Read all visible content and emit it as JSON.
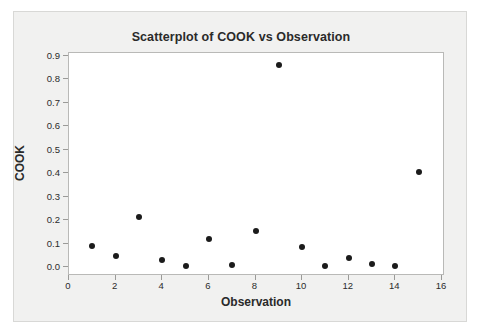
{
  "chart_data": {
    "type": "scatter",
    "title": "Scatterplot of COOK vs Observation",
    "xlabel": "Observation",
    "ylabel": "COOK",
    "xlim": [
      0,
      16
    ],
    "ylim": [
      0.0,
      0.9
    ],
    "xticks": [
      "0",
      "2",
      "4",
      "6",
      "8",
      "10",
      "12",
      "14",
      "16"
    ],
    "xtick_values": [
      0,
      2,
      4,
      6,
      8,
      10,
      12,
      14,
      16
    ],
    "yticks": [
      "0.0",
      "0.1",
      "0.2",
      "0.3",
      "0.4",
      "0.5",
      "0.6",
      "0.7",
      "0.8",
      "0.9"
    ],
    "ytick_values": [
      0.0,
      0.1,
      0.2,
      0.3,
      0.4,
      0.5,
      0.6,
      0.7,
      0.8,
      0.9
    ],
    "grid": false,
    "legend": false,
    "marker_color": "#1b1b1b",
    "marker": "circle",
    "series": [
      {
        "name": "COOK",
        "x": [
          1,
          2,
          3,
          4,
          5,
          6,
          7,
          8,
          9,
          10,
          11,
          12,
          13,
          14,
          15
        ],
        "y": [
          0.09,
          0.047,
          0.212,
          0.029,
          0.004,
          0.12,
          0.01,
          0.154,
          0.862,
          0.085,
          0.004,
          0.038,
          0.012,
          0.003,
          0.406
        ]
      }
    ],
    "points": [
      {
        "x": 1,
        "y": 0.09
      },
      {
        "x": 2,
        "y": 0.047
      },
      {
        "x": 3,
        "y": 0.212
      },
      {
        "x": 4,
        "y": 0.029
      },
      {
        "x": 5,
        "y": 0.004
      },
      {
        "x": 6,
        "y": 0.12
      },
      {
        "x": 7,
        "y": 0.01
      },
      {
        "x": 8,
        "y": 0.154
      },
      {
        "x": 9,
        "y": 0.862
      },
      {
        "x": 10,
        "y": 0.085
      },
      {
        "x": 11,
        "y": 0.004
      },
      {
        "x": 12,
        "y": 0.038
      },
      {
        "x": 13,
        "y": 0.012
      },
      {
        "x": 14,
        "y": 0.003
      },
      {
        "x": 15,
        "y": 0.406
      }
    ]
  },
  "colors": {
    "card_background": "#f1f1f0",
    "plot_background": "#ffffff",
    "frame_border": "#b9b9b7",
    "text": "#2a2a2a",
    "marker": "#1b1b1b"
  }
}
